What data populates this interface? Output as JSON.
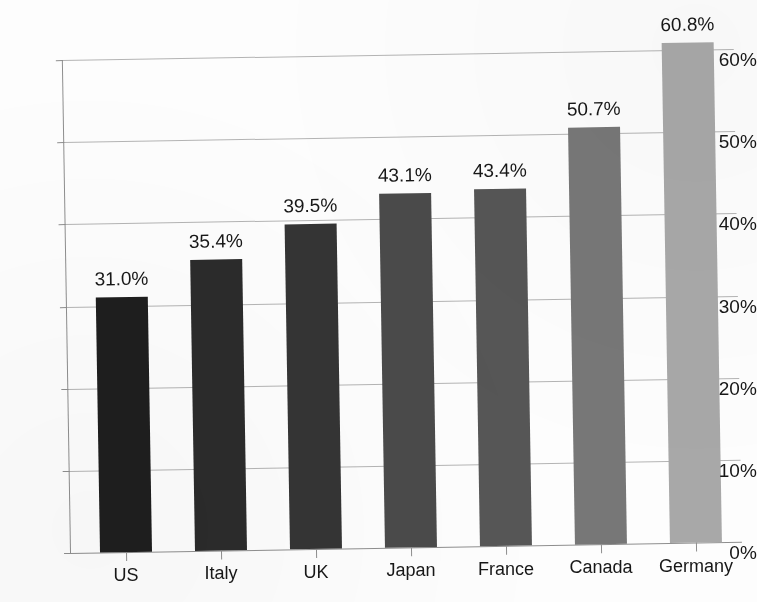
{
  "chart_data": {
    "type": "bar",
    "title": "",
    "subtitle": "",
    "xlabel": "",
    "ylabel": "",
    "categories": [
      "US",
      "Italy",
      "UK",
      "Japan",
      "France",
      "Canada",
      "Germany"
    ],
    "values": [
      31.0,
      35.4,
      39.5,
      43.1,
      43.4,
      50.7,
      60.8
    ],
    "value_labels": [
      "31.0%",
      "35.4%",
      "39.5%",
      "43.1%",
      "43.4%",
      "50.7%",
      "60.8%"
    ],
    "bar_colors": [
      "#1e1e1e",
      "#2b2b2b",
      "#343434",
      "#4a4a4a",
      "#565656",
      "#777777",
      "#a8a8a8"
    ],
    "ylim": [
      0,
      60
    ],
    "ytick_values": [
      0,
      10,
      20,
      30,
      40,
      50,
      60
    ],
    "ytick_labels": [
      "0%",
      "10%",
      "20%",
      "30%",
      "40%",
      "50%",
      "60%"
    ],
    "grid": true,
    "legend": "none",
    "value_labels_shown": true,
    "axis_color": "#8e8e8e",
    "grid_color": "#b4b4b4",
    "text_color": "#171717",
    "background_color": "#fdfdfd"
  }
}
